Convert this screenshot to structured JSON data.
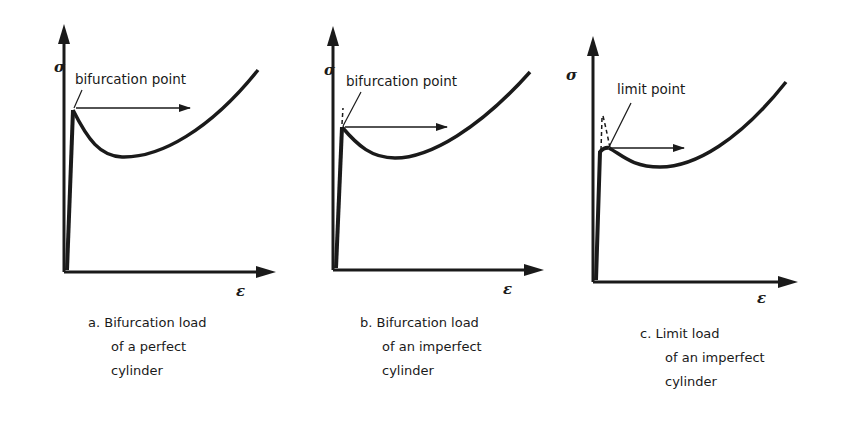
{
  "figure": {
    "panels": [
      {
        "id": "a",
        "y_axis_label": "σ",
        "x_axis_label": "ε",
        "point_label": "bifurcation point",
        "caption_lines": [
          "a. Bifurcation load",
          "of a perfect",
          "cylinder"
        ],
        "has_imperfection_path": false
      },
      {
        "id": "b",
        "y_axis_label": "σ",
        "x_axis_label": "ε",
        "point_label": "bifurcation point",
        "caption_lines": [
          "b. Bifurcation load",
          "of an imperfect",
          "cylinder"
        ],
        "has_imperfection_path": true
      },
      {
        "id": "c",
        "y_axis_label": "σ",
        "x_axis_label": "ε",
        "point_label": "limit point",
        "caption_lines": [
          "c. Limit load",
          "of an imperfect",
          "cylinder"
        ],
        "has_imperfection_path": true
      }
    ],
    "colors": {
      "ink": "#1a1a1a",
      "background": "#ffffff",
      "bleed_through": "#d9d9d9"
    }
  }
}
